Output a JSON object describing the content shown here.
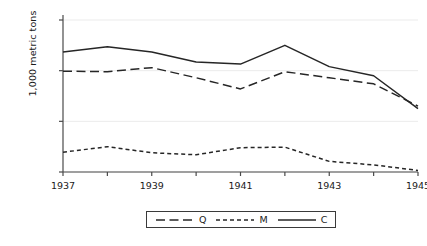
{
  "chart_data": {
    "type": "line",
    "title": "",
    "xlabel": "",
    "ylabel": "1,000 metric tons",
    "x": [
      1937,
      1938,
      1939,
      1940,
      1941,
      1942,
      1943,
      1944,
      1945
    ],
    "xlim": [
      1937,
      1945
    ],
    "ylim": [
      0,
      15000
    ],
    "xticks": [
      1937,
      1938,
      1939,
      1940,
      1941,
      1942,
      1943,
      1944,
      1945
    ],
    "xticklabels": [
      "1937",
      "",
      "1939",
      "",
      "1941",
      "",
      "1943",
      "",
      "1945"
    ],
    "yticks": [
      0,
      5000,
      10000,
      15000
    ],
    "yticklabels": [
      "0",
      "5,000",
      "10,000",
      "15,000"
    ],
    "grid": "horizontal",
    "legend_position": "bottom-center",
    "series": [
      {
        "name": "Q",
        "dash": "long-dash",
        "color": "#262626",
        "values": [
          9950,
          9900,
          10300,
          9300,
          8200,
          9900,
          9300,
          8700,
          6500
        ]
      },
      {
        "name": "M",
        "dash": "short-dash",
        "color": "#262626",
        "values": [
          1950,
          2500,
          1900,
          1700,
          2400,
          2450,
          1050,
          700,
          150
        ]
      },
      {
        "name": "C",
        "dash": "solid",
        "color": "#262626",
        "values": [
          11850,
          12350,
          11850,
          10850,
          10650,
          12500,
          10400,
          9500,
          6250
        ]
      }
    ]
  },
  "legend": {
    "entries": [
      {
        "label": "Q"
      },
      {
        "label": "M"
      },
      {
        "label": "C"
      }
    ]
  },
  "colors": {
    "line": "#262626",
    "axis": "#4a4a4a",
    "grid": "#ebebeb",
    "text": "#1a1a1a",
    "background": "#ffffff"
  }
}
